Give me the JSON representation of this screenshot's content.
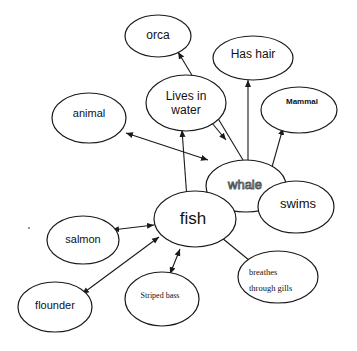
{
  "diagram": {
    "type": "concept-map",
    "nodes": {
      "orca": {
        "label": "orca"
      },
      "has_hair": {
        "label": "Has hair"
      },
      "lives_in_water": {
        "line1": "Lives in",
        "line2": "water"
      },
      "animal": {
        "label": "animal"
      },
      "mammal": {
        "label": "Mammal"
      },
      "whale": {
        "label": "whale"
      },
      "fish": {
        "label": "fish"
      },
      "swims": {
        "label": "swims"
      },
      "salmon": {
        "label": "salmon"
      },
      "striped_bass": {
        "label": "Striped bass"
      },
      "breathes_through_gills": {
        "line1": "breathes",
        "line2": "through gills"
      },
      "flounder": {
        "label": "flounder"
      }
    },
    "edges": [
      {
        "from": "whale",
        "to": "orca",
        "arrow": "to"
      },
      {
        "from": "whale",
        "to": "has_hair",
        "arrow": "to"
      },
      {
        "from": "whale",
        "to": "mammal",
        "arrow": "to"
      },
      {
        "from": "whale",
        "to": "lives_in_water",
        "arrow": "both"
      },
      {
        "from": "whale",
        "to": "animal",
        "arrow": "both"
      },
      {
        "from": "whale",
        "to": "swims",
        "arrow": "both"
      },
      {
        "from": "whale",
        "to": "fish",
        "arrow": "none"
      },
      {
        "from": "fish",
        "to": "lives_in_water",
        "arrow": "both"
      },
      {
        "from": "fish",
        "to": "swims",
        "arrow": "to"
      },
      {
        "from": "fish",
        "to": "breathes_through_gills",
        "arrow": "to"
      },
      {
        "from": "fish",
        "to": "salmon",
        "arrow": "both"
      },
      {
        "from": "fish",
        "to": "striped_bass",
        "arrow": "both"
      },
      {
        "from": "fish",
        "to": "flounder",
        "arrow": "both"
      }
    ]
  }
}
